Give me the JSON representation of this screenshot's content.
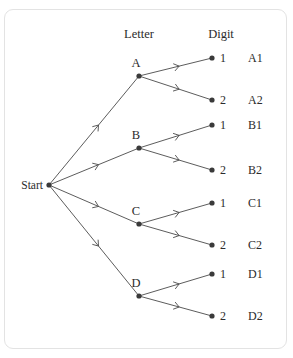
{
  "figure": {
    "type": "probability-tree-diagram",
    "title": "",
    "background_color": "#ffffff",
    "border_color": "#e3e3e3",
    "line_color": "#4a4a4a",
    "node_color": "#3a3a3a",
    "text_color": "#2b2b2b"
  },
  "headers": [
    {
      "label": "Letter",
      "x": 139,
      "y": 38
    },
    {
      "label": "Digit",
      "x": 221,
      "y": 38
    }
  ],
  "root": {
    "label": "Start",
    "label_x": 43,
    "label_y": 189,
    "node_x": 49,
    "node_y": 185
  },
  "level1": [
    {
      "label": "A",
      "label_x": 136,
      "label_y": 67,
      "node_x": 139,
      "node_y": 76
    },
    {
      "label": "B",
      "label_x": 136,
      "label_y": 139,
      "node_x": 139,
      "node_y": 148
    },
    {
      "label": "C",
      "label_x": 136,
      "label_y": 215,
      "node_x": 139,
      "node_y": 224
    },
    {
      "label": "D",
      "label_x": 136,
      "label_y": 287,
      "node_x": 139,
      "node_y": 296
    }
  ],
  "level2": [
    {
      "digit": "1",
      "outcome": "A1",
      "parent": "A",
      "node_x": 212,
      "node_y": 58,
      "digit_x": 220,
      "outcome_x": 248,
      "text_y": 62
    },
    {
      "digit": "2",
      "outcome": "A2",
      "parent": "A",
      "node_x": 212,
      "node_y": 100,
      "digit_x": 220,
      "outcome_x": 248,
      "text_y": 104
    },
    {
      "digit": "1",
      "outcome": "B1",
      "parent": "B",
      "node_x": 212,
      "node_y": 125,
      "digit_x": 220,
      "outcome_x": 248,
      "text_y": 129
    },
    {
      "digit": "2",
      "outcome": "B2",
      "parent": "B",
      "node_x": 212,
      "node_y": 170,
      "digit_x": 220,
      "outcome_x": 248,
      "text_y": 174
    },
    {
      "digit": "1",
      "outcome": "C1",
      "parent": "C",
      "node_x": 212,
      "node_y": 203,
      "digit_x": 220,
      "outcome_x": 248,
      "text_y": 207
    },
    {
      "digit": "2",
      "outcome": "C2",
      "parent": "C",
      "node_x": 212,
      "node_y": 245,
      "digit_x": 220,
      "outcome_x": 248,
      "text_y": 249
    },
    {
      "digit": "1",
      "outcome": "D1",
      "parent": "D",
      "node_x": 212,
      "node_y": 274,
      "digit_x": 220,
      "outcome_x": 248,
      "text_y": 278
    },
    {
      "digit": "2",
      "outcome": "D2",
      "parent": "D",
      "node_x": 212,
      "node_y": 316,
      "digit_x": 220,
      "outcome_x": 248,
      "text_y": 320
    }
  ],
  "edges": [
    {
      "from": "Start",
      "to": "A",
      "x1": 49,
      "y1": 185,
      "x2": 139,
      "y2": 76
    },
    {
      "from": "Start",
      "to": "B",
      "x1": 49,
      "y1": 185,
      "x2": 139,
      "y2": 148
    },
    {
      "from": "Start",
      "to": "C",
      "x1": 49,
      "y1": 185,
      "x2": 139,
      "y2": 224
    },
    {
      "from": "Start",
      "to": "D",
      "x1": 49,
      "y1": 185,
      "x2": 139,
      "y2": 296
    },
    {
      "from": "A",
      "to": "A1",
      "x1": 139,
      "y1": 76,
      "x2": 212,
      "y2": 58
    },
    {
      "from": "A",
      "to": "A2",
      "x1": 139,
      "y1": 76,
      "x2": 212,
      "y2": 100
    },
    {
      "from": "B",
      "to": "B1",
      "x1": 139,
      "y1": 148,
      "x2": 212,
      "y2": 125
    },
    {
      "from": "B",
      "to": "B2",
      "x1": 139,
      "y1": 148,
      "x2": 212,
      "y2": 170
    },
    {
      "from": "C",
      "to": "C1",
      "x1": 139,
      "y1": 224,
      "x2": 212,
      "y2": 203
    },
    {
      "from": "C",
      "to": "C2",
      "x1": 139,
      "y1": 224,
      "x2": 212,
      "y2": 245
    },
    {
      "from": "D",
      "to": "D1",
      "x1": 139,
      "y1": 296,
      "x2": 212,
      "y2": 274
    },
    {
      "from": "D",
      "to": "D2",
      "x1": 139,
      "y1": 296,
      "x2": 212,
      "y2": 316
    }
  ]
}
